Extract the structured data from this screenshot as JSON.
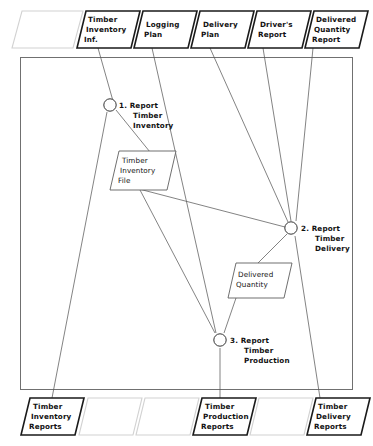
{
  "diagram": {
    "type": "data-flow-diagram",
    "system_boundary": {
      "label": ""
    },
    "external_inputs": [
      {
        "id": "in-blank-0",
        "label": "",
        "empty": true
      },
      {
        "id": "in-timber-inventory-inf",
        "label": "Timber\nInventory\nInf.",
        "lines": [
          "Timber",
          "Inventory",
          "Inf."
        ]
      },
      {
        "id": "in-logging-plan",
        "label": "Logging\nPlan",
        "lines": [
          "Logging",
          "Plan"
        ]
      },
      {
        "id": "in-delivery-plan",
        "label": "Delivery\nPlan",
        "lines": [
          "Delivery",
          "Plan"
        ]
      },
      {
        "id": "in-drivers-report",
        "label": "Driver's\nReport",
        "lines": [
          "Driver's",
          "Report"
        ]
      },
      {
        "id": "in-delivered-quantity-report",
        "label": "Delivered\nQuantity\nReport",
        "lines": [
          "Delivered",
          "Quantity",
          "Report"
        ]
      }
    ],
    "processes": [
      {
        "id": "process-1",
        "number": "1.",
        "lines": [
          "1. Report",
          "Timber",
          "Inventory"
        ],
        "name": "Report Timber Inventory"
      },
      {
        "id": "process-2",
        "number": "2.",
        "lines": [
          "2. Report",
          "Timber",
          "Delivery"
        ],
        "name": "Report Timber Delivery"
      },
      {
        "id": "process-3",
        "number": "3.",
        "lines": [
          "3. Report",
          "Timber",
          "Production"
        ],
        "name": "Report Timber Production"
      }
    ],
    "data_stores": [
      {
        "id": "store-timber-inventory-file",
        "lines": [
          "Timber",
          "Inventory",
          "File"
        ],
        "name": "Timber Inventory File"
      },
      {
        "id": "store-delivered-quantity",
        "lines": [
          "Delivered",
          "Quantity"
        ],
        "name": "Delivered Quantity"
      }
    ],
    "external_outputs": [
      {
        "id": "out-timber-inventory-reports",
        "lines": [
          "Timber",
          "Inventory",
          "Reports"
        ],
        "name": "Timber Inventory Reports"
      },
      {
        "id": "out-blank-1",
        "lines": [],
        "empty": true
      },
      {
        "id": "out-blank-2",
        "lines": [],
        "empty": true
      },
      {
        "id": "out-timber-production-reports",
        "lines": [
          "Timber",
          "Production",
          "Reports"
        ],
        "name": "Timber Production Reports"
      },
      {
        "id": "out-blank-3",
        "lines": [],
        "empty": true
      },
      {
        "id": "out-timber-delivery-reports",
        "lines": [
          "Timber",
          "Delivery",
          "Reports"
        ],
        "name": "Timber Delivery Reports"
      }
    ],
    "colors": {
      "background": "#ffffff",
      "stroke_strong": "#1a1a1a",
      "stroke_faint": "#d2d2d2",
      "stroke_flow": "#5a5a5a",
      "boundary": "#707070",
      "text": "#111111"
    }
  }
}
